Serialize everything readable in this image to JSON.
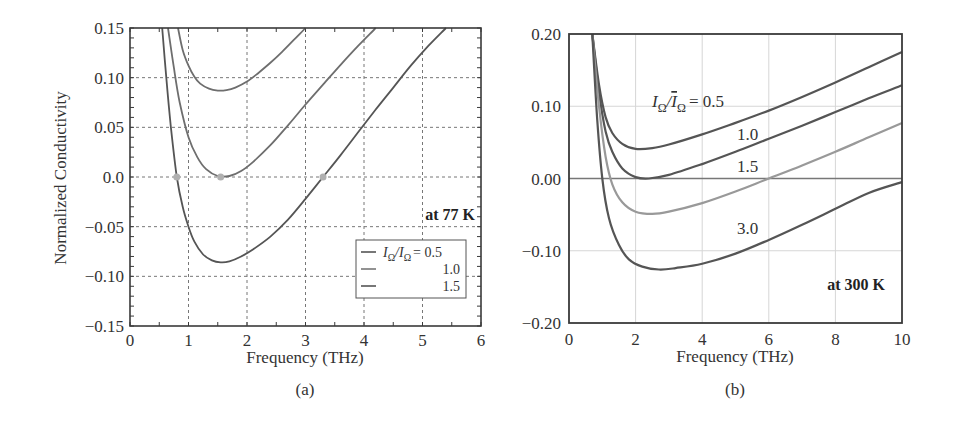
{
  "chart_data": [
    {
      "panel": "(a)",
      "type": "line",
      "title": "",
      "xlabel": "Frequency (THz)",
      "ylabel": "Normalized Conductivity",
      "xlim": [
        0,
        6
      ],
      "ylim": [
        -0.15,
        0.15
      ],
      "xticks": [
        "0",
        "1",
        "2",
        "3",
        "4",
        "5",
        "6"
      ],
      "yticks": [
        "0.15",
        "0.10",
        "0.05",
        "0.0",
        "−0.05",
        "−0.10",
        "−0.15"
      ],
      "grid": true,
      "annotation": "at 77 K",
      "legend": {
        "position": "lower right",
        "title_expr": "IΩ/IΩ = ",
        "entries": [
          "0.5",
          "1.0",
          "1.5"
        ]
      },
      "series": [
        {
          "name": "0.5",
          "x": [
            0.82,
            0.9,
            1.0,
            1.1,
            1.2,
            1.35,
            1.5,
            1.65,
            1.8,
            2.0,
            2.2,
            2.4,
            2.6,
            2.8,
            3.0
          ],
          "y": [
            0.15,
            0.128,
            0.112,
            0.101,
            0.094,
            0.089,
            0.087,
            0.0875,
            0.09,
            0.096,
            0.105,
            0.115,
            0.126,
            0.138,
            0.15
          ]
        },
        {
          "name": "1.0",
          "x": [
            0.65,
            0.75,
            0.85,
            1.0,
            1.15,
            1.3,
            1.5,
            1.7,
            1.9,
            2.1,
            2.4,
            2.7,
            3.0,
            3.3,
            3.6,
            3.9,
            4.2
          ],
          "y": [
            0.15,
            0.11,
            0.075,
            0.04,
            0.02,
            0.008,
            0.001,
            0.001,
            0.006,
            0.015,
            0.032,
            0.052,
            0.073,
            0.093,
            0.113,
            0.132,
            0.15
          ]
        },
        {
          "name": "1.5",
          "x": [
            0.55,
            0.62,
            0.7,
            0.8,
            0.9,
            1.0,
            1.1,
            1.25,
            1.4,
            1.55,
            1.7,
            1.9,
            2.1,
            2.4,
            2.7,
            3.0,
            3.3,
            3.6,
            3.9,
            4.2,
            4.5,
            4.8,
            5.1,
            5.4
          ],
          "y": [
            0.15,
            0.1,
            0.05,
            0.0,
            -0.03,
            -0.05,
            -0.065,
            -0.078,
            -0.084,
            -0.086,
            -0.085,
            -0.08,
            -0.073,
            -0.06,
            -0.043,
            -0.022,
            0.0,
            0.022,
            0.045,
            0.068,
            0.09,
            0.112,
            0.132,
            0.15
          ]
        }
      ],
      "markers": [
        {
          "x": 0.8,
          "y": 0.0
        },
        {
          "x": 1.55,
          "y": 0.0
        },
        {
          "x": 3.3,
          "y": 0.0
        }
      ]
    },
    {
      "panel": "(b)",
      "type": "line",
      "title": "",
      "xlabel": "Frequency (THz)",
      "ylabel": "",
      "xlim": [
        0,
        10
      ],
      "ylim": [
        -0.2,
        0.2
      ],
      "xticks": [
        "0",
        "2",
        "4",
        "6",
        "8",
        "10"
      ],
      "yticks": [
        "0.20",
        "0.10",
        "0.00",
        "−0.10",
        "−0.20"
      ],
      "grid": true,
      "annotation": "at 300 K",
      "curve_label_expr": "IΩ/ĪΩ = ",
      "series": [
        {
          "name": "0.5",
          "x": [
            0.7,
            0.9,
            1.1,
            1.3,
            1.6,
            2.0,
            2.5,
            3.0,
            4.0,
            5.0,
            6.0,
            7.0,
            8.0,
            9.0,
            10.0
          ],
          "y": [
            0.2,
            0.13,
            0.085,
            0.063,
            0.048,
            0.041,
            0.042,
            0.047,
            0.061,
            0.077,
            0.094,
            0.113,
            0.133,
            0.154,
            0.175
          ]
        },
        {
          "name": "1.0",
          "x": [
            0.7,
            0.9,
            1.1,
            1.3,
            1.6,
            2.0,
            2.4,
            3.0,
            4.0,
            5.0,
            6.0,
            7.0,
            8.0,
            9.0,
            10.0
          ],
          "y": [
            0.2,
            0.12,
            0.065,
            0.037,
            0.014,
            0.002,
            0.0,
            0.005,
            0.02,
            0.037,
            0.055,
            0.073,
            0.092,
            0.111,
            0.129
          ]
        },
        {
          "name": "1.5",
          "x": [
            0.7,
            0.9,
            1.1,
            1.3,
            1.6,
            2.0,
            2.5,
            3.0,
            4.0,
            5.0,
            6.0,
            7.0,
            8.0,
            9.0,
            10.0
          ],
          "y": [
            0.2,
            0.1,
            0.03,
            -0.008,
            -0.033,
            -0.046,
            -0.049,
            -0.046,
            -0.034,
            -0.018,
            0.0,
            0.018,
            0.037,
            0.057,
            0.077
          ]
        },
        {
          "name": "3.0",
          "x": [
            0.7,
            0.85,
            1.0,
            1.2,
            1.5,
            1.8,
            2.2,
            2.7,
            3.2,
            4.0,
            5.0,
            6.0,
            7.0,
            8.0,
            9.0,
            10.0
          ],
          "y": [
            0.2,
            0.08,
            0.0,
            -0.055,
            -0.092,
            -0.112,
            -0.122,
            -0.126,
            -0.124,
            -0.118,
            -0.104,
            -0.085,
            -0.064,
            -0.042,
            -0.02,
            -0.005
          ]
        }
      ],
      "series_label_positions": [
        {
          "name": "0.5",
          "x": 5.0,
          "y": 0.095
        },
        {
          "name": "1.0",
          "x": 4.7,
          "y": 0.068
        },
        {
          "name": "1.5",
          "x": 4.7,
          "y": 0.03
        },
        {
          "name": "3.0",
          "x": 4.7,
          "y": -0.075
        }
      ]
    }
  ],
  "panel_a": {
    "caption": "(a)",
    "xlabel": "Frequency (THz)",
    "ylabel": "Normalized Conductivity",
    "annotation": "at 77 K",
    "legend": {
      "title_main": "I",
      "sub": "Ω",
      "slash": "/",
      "eq": "= 0.5",
      "entry2": "1.0",
      "entry3": "1.5"
    }
  },
  "panel_b": {
    "caption": "(b)",
    "xlabel": "Frequency (THz)",
    "annotation": "at 300 K",
    "label_main": "I",
    "label_sub": "Ω",
    "label_eq": "= 0.5",
    "label_2": "1.0",
    "label_3": "1.5",
    "label_4": "3.0"
  },
  "colors": {
    "axis": "#3a3a3a",
    "grid": "#777777",
    "grid_b": "#d6d6d6",
    "curve_dark": "#555555",
    "curve_mid": "#6e6e6e",
    "curve_light": "#999999",
    "marker": "#b0b0b0"
  }
}
